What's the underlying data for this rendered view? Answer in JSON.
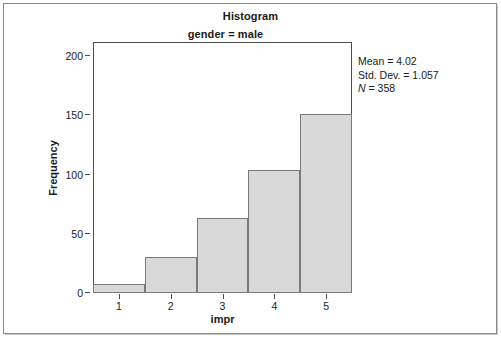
{
  "chart_data": {
    "type": "bar",
    "title": "Histogram",
    "subtitle": "gender = male",
    "xlabel": "impr",
    "ylabel": "Frequency",
    "categories": [
      "1",
      "2",
      "3",
      "4",
      "5"
    ],
    "values": [
      8,
      30,
      63,
      104,
      151
    ],
    "xlim": [
      0.5,
      5.5
    ],
    "ylim": [
      0,
      212
    ],
    "ytick_values": [
      0,
      50,
      100,
      150,
      200
    ],
    "ytick_labels": [
      "0",
      "50",
      "100",
      "150",
      "200"
    ],
    "xtick_values": [
      1,
      2,
      3,
      4,
      5
    ],
    "xtick_labels": [
      "1",
      "2",
      "3",
      "4",
      "5"
    ],
    "grid": false,
    "legend": "none",
    "bar_fill_color": "#d9d9d9",
    "bar_edge_color": "#7a7a7a",
    "annotations": [
      "Mean = 4.02",
      "Std. Dev. = 1.057",
      "N = 358"
    ]
  },
  "stats": {
    "mean_label": "Mean = 4.02",
    "stddev_label": "Std. Dev. = 1.057",
    "n_symbol": "N",
    "n_value": " = 358"
  }
}
